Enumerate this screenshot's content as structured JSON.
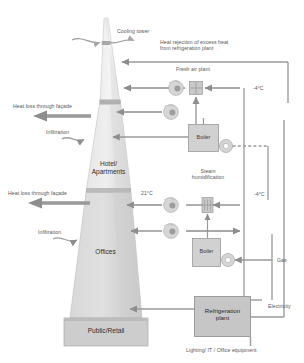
{
  "diagram": {
    "title_watermark": "",
    "building": {
      "zones": [
        {
          "id": "hotel",
          "label": "Hotel/\nApartments"
        },
        {
          "id": "offices",
          "label": "Offices"
        },
        {
          "id": "public",
          "label": "Public/Retail"
        }
      ]
    },
    "annotations": {
      "cooling_tower": "Cooling tower",
      "heat_rejection": "Heat rejection of excess heat\nfrom refrigeration plant",
      "fresh_air_plant": "Fresh air plant",
      "steam_humidification": "Steam\nhumidification",
      "heat_loss_upper": "Heat loss through façade",
      "heat_loss_lower": "Heat loss through façade",
      "infiltration_upper": "Infiltration",
      "infiltration_lower": "Infiltration",
      "gas": "Gas",
      "electricity": "Electricity",
      "loads_caption": "Lighting/ IT / Office equipment"
    },
    "temperatures": [
      {
        "id": "fresh-air-top",
        "value": "-4°C"
      },
      {
        "id": "fresh-air-mid",
        "value": "-4°C"
      },
      {
        "id": "supply-air",
        "value": "21°C"
      }
    ],
    "equipment": [
      {
        "id": "boiler-upper",
        "label": "Boiler"
      },
      {
        "id": "boiler-lower",
        "label": "Boiler"
      },
      {
        "id": "refrigeration-plant",
        "label": "Refrigeration\nplant"
      }
    ],
    "icons": {
      "fan": "fan-icon",
      "coil": "heating-coil-icon",
      "pump": "pump-icon",
      "humidifier": "humidifier-icon"
    },
    "colors": {
      "tower_fill": "#d4d4d4",
      "tower_fill_light": "#e2e2e2",
      "tower_fill_dark": "#c8c8c8",
      "band": "#b5b5b5",
      "box_fill": "#d0d0d0",
      "box_stroke": "#8a8a8a",
      "arrow": "#8d8d8d",
      "line": "#9a9a9a",
      "text": "#4a4a4a"
    }
  }
}
